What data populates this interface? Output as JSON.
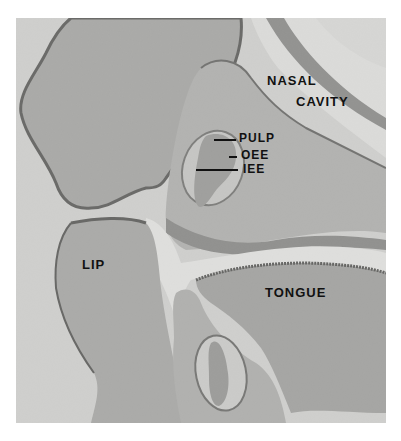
{
  "figure": {
    "type": "histology micrograph",
    "labels": {
      "nasal": "NASAL",
      "cavity": "CAVITY",
      "pulp": "PULP",
      "oee": "OEE",
      "iee": "IEE",
      "lip": "LIP",
      "tongue": "TONGUE"
    }
  }
}
